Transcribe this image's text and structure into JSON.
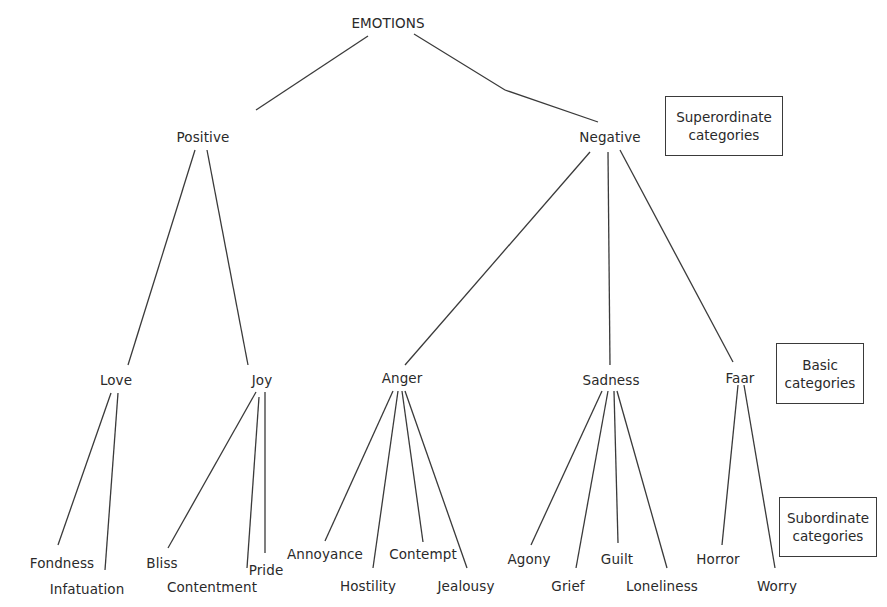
{
  "diagram": {
    "root": {
      "label": "EMOTIONS",
      "x": 388,
      "y": 15
    },
    "superordinate": [
      {
        "id": "positive",
        "label": "Positive",
        "x": 203,
        "y": 129
      },
      {
        "id": "negative",
        "label": "Negative",
        "x": 610,
        "y": 129
      }
    ],
    "basic": [
      {
        "id": "love",
        "label": "Love",
        "parent": "positive",
        "x": 116,
        "y": 372
      },
      {
        "id": "joy",
        "label": "Joy",
        "parent": "positive",
        "x": 262,
        "y": 372
      },
      {
        "id": "anger",
        "label": "Anger",
        "parent": "negative",
        "x": 402,
        "y": 370
      },
      {
        "id": "sadness",
        "label": "Sadness",
        "parent": "negative",
        "x": 611,
        "y": 372
      },
      {
        "id": "fear",
        "label": "Faar",
        "parent": "negative",
        "x": 740,
        "y": 370
      }
    ],
    "subordinate": [
      {
        "label": "Fondness",
        "parent": "love",
        "x": 62,
        "y": 555
      },
      {
        "label": "Infatuation",
        "parent": "love",
        "x": 87,
        "y": 581
      },
      {
        "label": "Bliss",
        "parent": "joy",
        "x": 162,
        "y": 555
      },
      {
        "label": "Contentment",
        "parent": "joy",
        "x": 212,
        "y": 579
      },
      {
        "label": "Pride",
        "parent": "joy",
        "x": 266,
        "y": 562
      },
      {
        "label": "Annoyance",
        "parent": "anger",
        "x": 325,
        "y": 546
      },
      {
        "label": "Hostility",
        "parent": "anger",
        "x": 368,
        "y": 578
      },
      {
        "label": "Contempt",
        "parent": "anger",
        "x": 423,
        "y": 546
      },
      {
        "label": "Jealousy",
        "parent": "anger",
        "x": 466,
        "y": 578
      },
      {
        "label": "Agony",
        "parent": "sadness",
        "x": 529,
        "y": 551
      },
      {
        "label": "Grief",
        "parent": "sadness",
        "x": 568,
        "y": 578
      },
      {
        "label": "Guilt",
        "parent": "sadness",
        "x": 617,
        "y": 551
      },
      {
        "label": "Loneliness",
        "parent": "sadness",
        "x": 662,
        "y": 578
      },
      {
        "label": "Horror",
        "parent": "fear",
        "x": 718,
        "y": 551
      },
      {
        "label": "Worry",
        "parent": "fear",
        "x": 777,
        "y": 578
      }
    ],
    "edges": [
      [
        368,
        36,
        256,
        110
      ],
      [
        414,
        34,
        505,
        90
      ],
      [
        505,
        90,
        598,
        122
      ],
      [
        195,
        150,
        128,
        365
      ],
      [
        207,
        150,
        248,
        365
      ],
      [
        590,
        152,
        405,
        365
      ],
      [
        608,
        152,
        610,
        365
      ],
      [
        620,
        150,
        733,
        362
      ],
      [
        111,
        393,
        58,
        545
      ],
      [
        118,
        393,
        105,
        570
      ],
      [
        256,
        392,
        168,
        548
      ],
      [
        259,
        397,
        247,
        568
      ],
      [
        265,
        392,
        265,
        553
      ],
      [
        393,
        391,
        325,
        541
      ],
      [
        398,
        391,
        373,
        568
      ],
      [
        402,
        391,
        423,
        542
      ],
      [
        405,
        391,
        467,
        568
      ],
      [
        602,
        391,
        531,
        545
      ],
      [
        608,
        391,
        576,
        568
      ],
      [
        614,
        391,
        618,
        543
      ],
      [
        617,
        391,
        667,
        568
      ],
      [
        738,
        385,
        722,
        545
      ],
      [
        744,
        385,
        775,
        568
      ]
    ],
    "legend": [
      {
        "id": "superordinate",
        "line1": "Superordinate",
        "line2": "categories",
        "x": 665,
        "y": 96,
        "w": 118,
        "h": 60
      },
      {
        "id": "basic",
        "line1": "Basic",
        "line2": "categories",
        "x": 776,
        "y": 343,
        "w": 88,
        "h": 61
      },
      {
        "id": "subordinate",
        "line1": "Subordinate",
        "line2": "categories",
        "x": 779,
        "y": 497,
        "w": 98,
        "h": 60
      }
    ]
  }
}
